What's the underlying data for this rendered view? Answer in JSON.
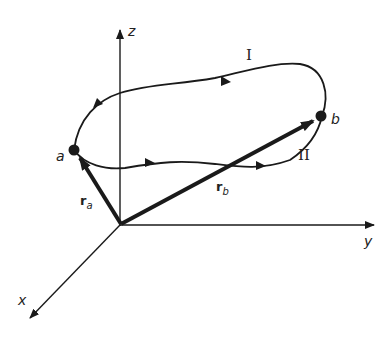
{
  "diagram": {
    "axes": {
      "x": "x",
      "y": "y",
      "z": "z"
    },
    "points": {
      "a": "a",
      "b": "b"
    },
    "paths": {
      "upper": "I",
      "lower": "II"
    },
    "vectors": {
      "ra": {
        "base": "r",
        "sub": "a"
      },
      "rb": {
        "base": "r",
        "sub": "b"
      }
    },
    "colors": {
      "ink": "#1a1a1a",
      "background": "#ffffff"
    }
  }
}
